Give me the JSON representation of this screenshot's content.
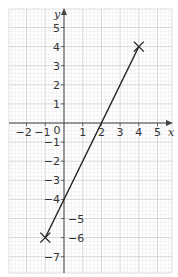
{
  "chart_data": {
    "type": "line",
    "title": "",
    "xlabel": "x",
    "ylabel": "y",
    "xlim": [
      -3,
      5.7
    ],
    "ylim": [
      -7.8,
      5.9
    ],
    "grid": true,
    "x_ticks": [
      -2,
      -1,
      1,
      2,
      3,
      4,
      5
    ],
    "x_tick_labels": [
      "−2",
      "−1",
      "1",
      "2",
      "3",
      "4",
      "5"
    ],
    "y_ticks": [
      5,
      4,
      3,
      2,
      1,
      -1,
      -2,
      -3,
      -4,
      -5,
      -6,
      -7
    ],
    "y_tick_labels": [
      "5",
      "4",
      "3",
      "2",
      "1",
      "−1",
      "−2",
      "−3",
      "−4",
      "−5",
      "−6",
      "−7"
    ],
    "origin_label": "0",
    "series": [
      {
        "name": "line segment",
        "x": [
          -1,
          4
        ],
        "y": [
          -6,
          4
        ],
        "endpoint_markers": "cross"
      }
    ],
    "annotations": [
      {
        "text": "×",
        "x": -1,
        "y": -6
      },
      {
        "text": "×",
        "x": 4,
        "y": 4
      }
    ]
  },
  "colors": {
    "grid_minor": "#e4e4e4",
    "grid_major": "#c8c8c8",
    "axis": "#444444",
    "line": "#222222"
  }
}
